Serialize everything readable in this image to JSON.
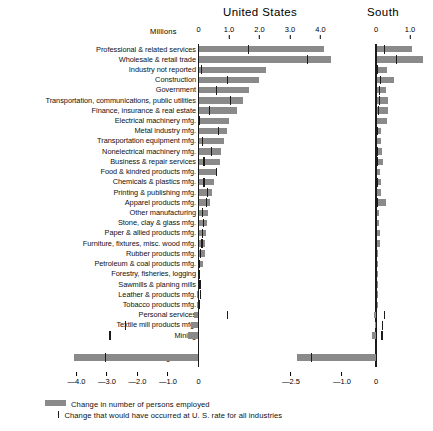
{
  "chart_data": {
    "type": "bar",
    "title": "",
    "panels": [
      {
        "name": "United States",
        "xlabel": "Millions",
        "xticks_top": [
          0,
          1.0,
          2.0,
          3.0,
          4.0
        ],
        "xticks_top_labels": [
          "0",
          "1.0",
          "2.0",
          "3.0",
          "4.0"
        ],
        "xticks_bottom": [
          -4.0,
          -3.0,
          -2.0,
          -1.0,
          0
        ],
        "xticks_bottom_labels": [
          "—4.0",
          "—3.0",
          "—2.0",
          "—1.0",
          "0"
        ],
        "xlim": [
          -4.6,
          4.65
        ],
        "units": "millions of persons"
      },
      {
        "name": "South",
        "xlabel": "",
        "xticks_top": [
          0,
          1.0
        ],
        "xticks_top_labels": [
          "0",
          "1.0"
        ],
        "xticks_bottom": [
          -2.5,
          -1.0,
          0
        ],
        "xticks_bottom_labels": [
          "—2.5",
          "—1.0",
          "0"
        ],
        "xlim": [
          -2.9,
          1.65
        ],
        "units": "millions of persons"
      }
    ],
    "units_label": "Millions",
    "categories": [
      "Professional & related services",
      "Wholesale & retail trade",
      "Industry not reported",
      "Construction",
      "Government",
      "Transportation, communications, public utilities",
      "Finance, insurance & real estate",
      "Electrical machinery mfg.",
      "Metal industry mfg.",
      "Transportation equipment mfg.",
      "Nonelectrical machinery mfg.",
      "Business & repair services",
      "Food & kindred products mfg.",
      "Chemicals & plastics mfg.",
      "Printing & publishing mfg.",
      "Apparel products mfg.",
      "Other manufacturing",
      "Stone, clay & glass mfg.",
      "Paper & allied products mfg.",
      "Furniture, fixtures, misc. wood mfg.",
      "Rubber products mfg.",
      "Petroleum & coal products mfg.",
      "Forestry, fisheries, logging",
      "Sawmills & planing mills",
      "Leather & products mfg.",
      "Tobacco products mfg.",
      "Personal services",
      "Textile mill products mfg.",
      "Mining",
      "Agriculture"
    ],
    "series": [
      {
        "name": "United States — Change in number of persons employed",
        "panel": "United States",
        "values": [
          4.1,
          4.33,
          2.2,
          1.97,
          1.63,
          1.45,
          1.25,
          0.98,
          0.92,
          0.8,
          0.72,
          0.68,
          0.58,
          0.5,
          0.42,
          0.34,
          0.3,
          0.24,
          0.22,
          0.2,
          0.18,
          0.12,
          0.02,
          0.01,
          -0.03,
          -0.04,
          -0.14,
          -0.22,
          -0.32,
          -4.08
        ]
      },
      {
        "name": "United States — Change at U.S. rate for all industries",
        "panel": "United States",
        "type": "reference-mark",
        "values": [
          1.63,
          3.58,
          0.1,
          0.95,
          0.6,
          1.05,
          0.35,
          0.02,
          0.65,
          0.13,
          0.42,
          0.18,
          0.58,
          0.18,
          0.3,
          0.26,
          0.14,
          0.16,
          0.12,
          0.11,
          0.06,
          0.04,
          0.03,
          0.05,
          0.06,
          0.02,
          0.94,
          -2.4,
          -2.9,
          -3.05
        ]
      },
      {
        "name": "South — Change in number of persons employed",
        "panel": "South",
        "values": [
          1.05,
          1.35,
          0.3,
          0.52,
          0.28,
          0.33,
          0.34,
          0.3,
          0.12,
          0.14,
          0.15,
          0.18,
          0.09,
          0.14,
          0.13,
          0.26,
          0.08,
          0.07,
          0.1,
          0.09,
          0.04,
          0.03,
          0.01,
          0.02,
          0.02,
          0.01,
          -0.06,
          -0.03,
          -0.12,
          -2.3
        ]
      },
      {
        "name": "South — Change at U.S. rate for all industries",
        "panel": "South",
        "type": "reference-mark",
        "values": [
          0.26,
          0.6,
          0.04,
          0.14,
          0.11,
          0.1,
          0.08,
          0.02,
          0.04,
          0.02,
          0.03,
          0.04,
          0.02,
          0.03,
          0.02,
          0.03,
          0.02,
          0.02,
          0.02,
          0.02,
          0.01,
          0.01,
          0.01,
          0.01,
          0.01,
          0.01,
          0.26,
          0.2,
          0.18,
          -1.9
        ]
      }
    ],
    "legend": {
      "position": "bottom-left",
      "entries": [
        {
          "symbol": "bar-swatch",
          "label": "Change in number of persons employed"
        },
        {
          "symbol": "tick-mark",
          "label": "Change that would have occurred at U. S. rate for all industries"
        }
      ]
    },
    "grid": false,
    "bar_color": "#8a8a8a",
    "mark_color": "#1c1c1c"
  }
}
